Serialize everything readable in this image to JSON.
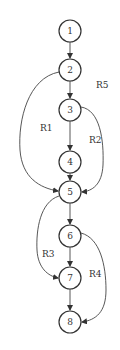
{
  "diagram": {
    "type": "control-flow-graph",
    "nodes": [
      {
        "id": "1",
        "label": "1",
        "x": 70,
        "y": 31
      },
      {
        "id": "2",
        "label": "2",
        "x": 70,
        "y": 70
      },
      {
        "id": "3",
        "label": "3",
        "x": 70,
        "y": 110
      },
      {
        "id": "4",
        "label": "4",
        "x": 70,
        "y": 162
      },
      {
        "id": "5",
        "label": "5",
        "x": 70,
        "y": 192
      },
      {
        "id": "6",
        "label": "6",
        "x": 70,
        "y": 236
      },
      {
        "id": "7",
        "label": "7",
        "x": 70,
        "y": 278
      },
      {
        "id": "8",
        "label": "8",
        "x": 70,
        "y": 322
      }
    ],
    "edges": [
      {
        "from": "1",
        "to": "2"
      },
      {
        "from": "2",
        "to": "3"
      },
      {
        "from": "2",
        "to": "5"
      },
      {
        "from": "3",
        "to": "4"
      },
      {
        "from": "3",
        "to": "5"
      },
      {
        "from": "4",
        "to": "5"
      },
      {
        "from": "5",
        "to": "6"
      },
      {
        "from": "5",
        "to": "7"
      },
      {
        "from": "6",
        "to": "7"
      },
      {
        "from": "6",
        "to": "8"
      },
      {
        "from": "7",
        "to": "8"
      }
    ],
    "regions": [
      {
        "label": "R1",
        "x": 40,
        "y": 131
      },
      {
        "label": "R2",
        "x": 89,
        "y": 143
      },
      {
        "label": "R3",
        "x": 42,
        "y": 257
      },
      {
        "label": "R4",
        "x": 89,
        "y": 277
      },
      {
        "label": "R5",
        "x": 96,
        "y": 88
      }
    ]
  }
}
